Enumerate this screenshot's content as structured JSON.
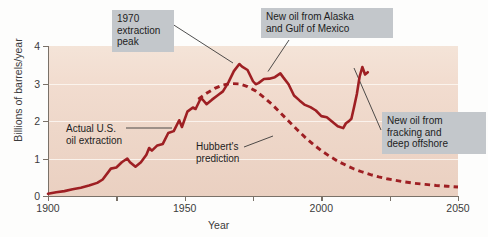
{
  "chart_data": {
    "type": "line",
    "title": "",
    "xlabel": "Year",
    "ylabel": "Billions of barrels/year",
    "xlim": [
      1900,
      2050
    ],
    "ylim": [
      0,
      4
    ],
    "xticks": [
      1900,
      1925,
      1950,
      1975,
      2000,
      2025,
      2050
    ],
    "xtick_labels": [
      "1900",
      "",
      "1950",
      "",
      "2000",
      "",
      "2050"
    ],
    "yticks": [
      0,
      1,
      2,
      3,
      4
    ],
    "ytick_labels": [
      "0",
      "1",
      "2",
      "3",
      "4"
    ],
    "grid": "horizontal-white",
    "legend": "none (inline annotations)",
    "accent_color": "#9e1f23",
    "plot_background": "#f0dacb",
    "callout_background": "#c3c7cb",
    "series": [
      {
        "name": "Actual U.S. oil extraction",
        "style": "solid",
        "color": "#9e1f23",
        "points": [
          [
            1900,
            0.06
          ],
          [
            1903,
            0.1
          ],
          [
            1906,
            0.13
          ],
          [
            1909,
            0.18
          ],
          [
            1912,
            0.22
          ],
          [
            1915,
            0.28
          ],
          [
            1918,
            0.35
          ],
          [
            1920,
            0.44
          ],
          [
            1923,
            0.73
          ],
          [
            1925,
            0.76
          ],
          [
            1927,
            0.9
          ],
          [
            1929,
            1.0
          ],
          [
            1930,
            0.9
          ],
          [
            1932,
            0.78
          ],
          [
            1934,
            0.9
          ],
          [
            1936,
            1.1
          ],
          [
            1937,
            1.28
          ],
          [
            1938,
            1.21
          ],
          [
            1940,
            1.35
          ],
          [
            1942,
            1.39
          ],
          [
            1944,
            1.68
          ],
          [
            1946,
            1.73
          ],
          [
            1948,
            2.02
          ],
          [
            1949,
            1.84
          ],
          [
            1951,
            2.25
          ],
          [
            1953,
            2.36
          ],
          [
            1954,
            2.32
          ],
          [
            1956,
            2.62
          ],
          [
            1958,
            2.45
          ],
          [
            1960,
            2.57
          ],
          [
            1962,
            2.68
          ],
          [
            1964,
            2.79
          ],
          [
            1966,
            3.03
          ],
          [
            1968,
            3.33
          ],
          [
            1970,
            3.52
          ],
          [
            1971,
            3.45
          ],
          [
            1973,
            3.36
          ],
          [
            1975,
            3.06
          ],
          [
            1976,
            2.98
          ],
          [
            1977,
            3.01
          ],
          [
            1979,
            3.12
          ],
          [
            1981,
            3.13
          ],
          [
            1983,
            3.17
          ],
          [
            1985,
            3.27
          ],
          [
            1986,
            3.17
          ],
          [
            1988,
            2.98
          ],
          [
            1990,
            2.68
          ],
          [
            1992,
            2.55
          ],
          [
            1994,
            2.43
          ],
          [
            1996,
            2.37
          ],
          [
            1998,
            2.28
          ],
          [
            2000,
            2.13
          ],
          [
            2002,
            2.1
          ],
          [
            2004,
            1.98
          ],
          [
            2006,
            1.86
          ],
          [
            2008,
            1.81
          ],
          [
            2009,
            1.94
          ],
          [
            2010,
            1.99
          ],
          [
            2011,
            2.06
          ],
          [
            2012,
            2.38
          ],
          [
            2013,
            2.72
          ],
          [
            2014,
            3.18
          ],
          [
            2015,
            3.44
          ],
          [
            2016,
            3.24
          ],
          [
            2017,
            3.3
          ]
        ]
      },
      {
        "name": "Hubbert's prediction",
        "style": "dashed",
        "color": "#9e1f23",
        "points": [
          [
            1955,
            2.58
          ],
          [
            1958,
            2.74
          ],
          [
            1961,
            2.87
          ],
          [
            1964,
            2.96
          ],
          [
            1967,
            3.0
          ],
          [
            1970,
            2.99
          ],
          [
            1973,
            2.92
          ],
          [
            1976,
            2.8
          ],
          [
            1979,
            2.63
          ],
          [
            1982,
            2.44
          ],
          [
            1985,
            2.22
          ],
          [
            1988,
            2.0
          ],
          [
            1991,
            1.78
          ],
          [
            1994,
            1.57
          ],
          [
            1997,
            1.38
          ],
          [
            2000,
            1.21
          ],
          [
            2003,
            1.06
          ],
          [
            2006,
            0.93
          ],
          [
            2009,
            0.82
          ],
          [
            2012,
            0.72
          ],
          [
            2015,
            0.64
          ],
          [
            2018,
            0.57
          ],
          [
            2021,
            0.51
          ],
          [
            2024,
            0.46
          ],
          [
            2027,
            0.42
          ],
          [
            2030,
            0.38
          ],
          [
            2034,
            0.34
          ],
          [
            2038,
            0.31
          ],
          [
            2042,
            0.28
          ],
          [
            2046,
            0.26
          ],
          [
            2050,
            0.24
          ]
        ]
      }
    ],
    "annotations": [
      {
        "id": "peak",
        "text": "1970\nextraction\npeak",
        "boxed": true,
        "points_to": [
          1970,
          3.52
        ]
      },
      {
        "id": "alaska",
        "text": "New oil from Alaska\nand Gulf of Mexico",
        "boxed": true,
        "points_to": [
          1985,
          3.27
        ]
      },
      {
        "id": "fracking",
        "text": "New oil from\nfracking and\ndeep offshore",
        "boxed": true,
        "points_to": [
          2015,
          3.44
        ]
      },
      {
        "id": "actual",
        "text": "Actual U.S.\noil extraction",
        "boxed": false,
        "points_to": [
          1945,
          1.72
        ]
      },
      {
        "id": "hubbert",
        "text": "Hubbert's\nprediction",
        "boxed": false,
        "points_to": [
          1997,
          1.38
        ]
      }
    ]
  },
  "axis": {
    "y_title": "Billions of barrels/year",
    "x_title": "Year"
  }
}
